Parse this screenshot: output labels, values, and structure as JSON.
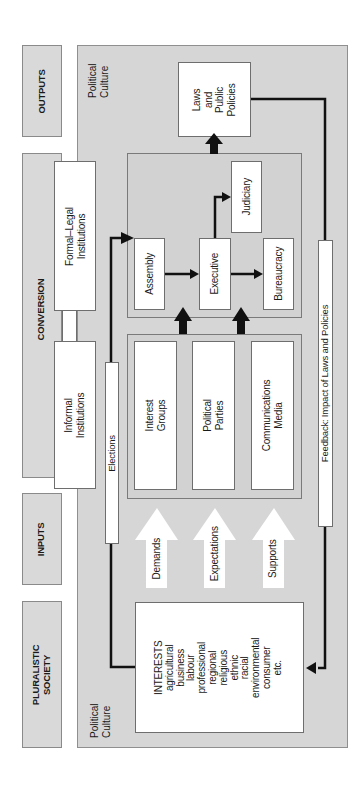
{
  "diagram": {
    "orientation": "rotated 90deg counter-clockwise",
    "stage_labels": {
      "outputs": "OUTPUTS",
      "conversion": "CONVERSION",
      "inputs": "INPUTS",
      "pluralistic_society": "PLURALISTIC\nSOCIETY"
    },
    "political_culture_label": "Political\nCulture",
    "institutions": {
      "formal_legal": "Formal–Legal\nInstitutions",
      "informal": "Informal\nInstitutions"
    },
    "output_box": "Laws\nand\nPublic\nPolicies",
    "conversion_bodies": {
      "assembly": "Assembly",
      "executive": "Executive",
      "judiciary": "Judiciary",
      "bureaucracy": "Bureaucracy"
    },
    "intermediaries": {
      "interest_groups": "Interest\nGroups",
      "political_parties": "Political\nParties",
      "communications_media": "Communications\nMedia"
    },
    "input_arrows": {
      "demands": "Demands",
      "expectations": "Expectations",
      "supports": "Supports"
    },
    "elections_label": "Elections",
    "feedback_label": "Feedback: Impact of Laws and Policies",
    "interests": {
      "heading": "INTERESTS",
      "items": [
        "agricultural",
        "business",
        "labour",
        "professional",
        "regional",
        "religious",
        "ethnic",
        "racial",
        "environmental",
        "consumer",
        "etc."
      ],
      "text": "INTERESTS\nagricultural\nbusiness\nlabour\nprofessional\nregional\nreligious\nethnic\nracial\nenvironmental\nconsumer\netc."
    },
    "colors": {
      "panel_grey": "#d6d6d6",
      "box_white": "#ffffff",
      "arrow_black": "#111111",
      "border_grey": "#8a8a8a"
    }
  }
}
